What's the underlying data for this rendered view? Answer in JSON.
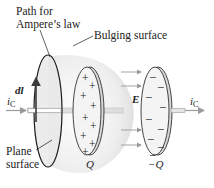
{
  "labels": {
    "path_line1": "Path for",
    "path_line2": "Ampere’s law",
    "bulging": "Bulging surface",
    "plane_line1": "Plane",
    "plane_line2": "surface",
    "dl": "dl",
    "field": "E",
    "current_left": "i",
    "current_right": "i",
    "current_sub": "C",
    "charge_pos": "Q",
    "charge_neg": "−Q"
  },
  "colors": {
    "outline": "#1a1a1a",
    "surface_fill": "#e9e9ea",
    "plate_fill": "#f0f0f0",
    "plate_edge": "#cfcfcf",
    "wire": "#d9d9d9",
    "arrow": "#9a9a9a",
    "dl_arrow": "#3a3a3a"
  },
  "plate_positive": {
    "signs": [
      "+",
      "+",
      "+",
      "+",
      "+",
      "+",
      "+",
      "+",
      "+",
      "+"
    ]
  },
  "plate_negative": {
    "signs": [
      "–",
      "–",
      "–",
      "–",
      "–",
      "–",
      "–",
      "–",
      "–",
      "–",
      "–"
    ]
  }
}
